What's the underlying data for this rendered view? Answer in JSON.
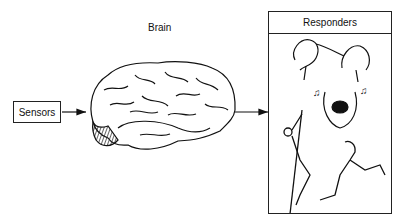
{
  "diagram": {
    "sensors": {
      "label": "Sensors"
    },
    "brain": {
      "label": "Brain"
    },
    "responders": {
      "label": "Responders",
      "illustrations": [
        "hands-threading-needle",
        "singing-mouth-with-music-notes",
        "man-climbing-rope",
        "man-running"
      ]
    },
    "edges": [
      {
        "from": "Sensors",
        "to": "Brain"
      },
      {
        "from": "Brain",
        "to": "Responders"
      }
    ]
  }
}
